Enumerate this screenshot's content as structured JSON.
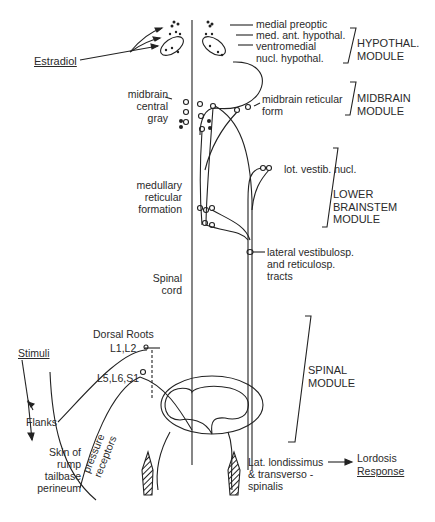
{
  "diagram": {
    "labels": {
      "estradiol": "Estradiol",
      "medial_preoptic": "medial preoptic",
      "med_ant_hypothal": "med. ant. hypothal.",
      "ventromedial": "ventromedial\nnucl. hypothal.",
      "midbrain_central_gray": "midbrain\ncentral\ngray",
      "midbrain_reticular_form": "midbrain reticular\nform",
      "lat_vestib_nucl": "lot. vestib. nucl.",
      "medullary_reticular_formation": "medullary\nreticular\nformation",
      "lateral_tracts": "lateral vestibulosp.\nand reticulosp.\ntracts",
      "spinal_cord": "Spinal\ncord",
      "dorsal_roots": "Dorsal Roots",
      "l1_l2": "L1,L2",
      "l5_l6_s1": "L5,L6,S1",
      "stimuli": "Stimuli",
      "flanks": "Flanks",
      "skin_of": "Skin of\nrump\ntailbase\nperineum",
      "pressure_receptors": "pressure\nreceptors",
      "muscles": "Lat. londissimus\n& transverso -\nspinalis",
      "lordosis": "Lordosis",
      "response": "Response"
    },
    "modules": {
      "hypothal": "HYPOTHAL.\nMODULE",
      "midbrain": "MIDBRAIN\nMODULE",
      "lower_brainstem": "LOWER\nBRAINSTEM\nMODULE",
      "spinal": "SPINAL\nMODULE"
    },
    "colors": {
      "ink": "#222222",
      "background": "#ffffff"
    }
  }
}
